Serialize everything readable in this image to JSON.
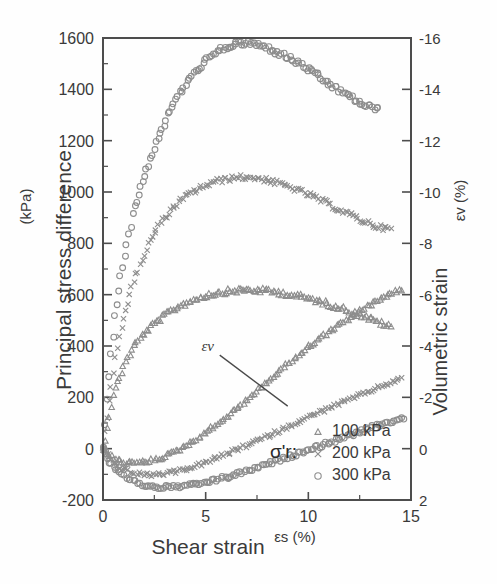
{
  "chart_data": {
    "type": "scatter",
    "title": "",
    "xlabel": "Shear strain",
    "xlabel_unit": "εs (%)",
    "ylabel_left": "Principal stress difference",
    "ylabel_left_unit": "(kPa)",
    "ylabel_right": "Volumetric strain",
    "ylabel_right_unit": "εv (%)",
    "xlim": [
      0,
      15
    ],
    "ylim_left": [
      -200,
      1600
    ],
    "ylim_right": [
      2,
      -16
    ],
    "grid": false,
    "legend_position": "bottom-right",
    "legend_title": "σ'r:",
    "x_ticks": [
      "0",
      "5",
      "10",
      "15"
    ],
    "x_tick_values": [
      0,
      5,
      10,
      15
    ],
    "y_ticks_left": [
      "-200",
      "0",
      "200",
      "400",
      "600",
      "800",
      "1000",
      "1200",
      "1400",
      "1600"
    ],
    "y_tick_values_left": [
      -200,
      0,
      200,
      400,
      600,
      800,
      1000,
      1200,
      1400,
      1600
    ],
    "y_ticks_right": [
      "2",
      "0",
      "-2",
      "-4",
      "-6",
      "-8",
      "-10",
      "-12",
      "-14",
      "-16"
    ],
    "y_tick_values_right": [
      2,
      0,
      -2,
      -4,
      -6,
      -8,
      -10,
      -12,
      -14,
      -16
    ],
    "annotations": [
      {
        "text": "εv",
        "x": 5.1,
        "y_left": 380,
        "note": "label for volumetric strain curves with leader line"
      }
    ],
    "legend": [
      {
        "label": "100 kPa",
        "marker": "triangle"
      },
      {
        "label": "200 kPa",
        "marker": "cross"
      },
      {
        "label": "300 kPa",
        "marker": "circle"
      }
    ],
    "series": [
      {
        "name": "100 kPa",
        "axis": "left",
        "quantity": "principal stress difference",
        "marker": "triangle",
        "x": [
          0.0,
          0.15,
          0.3,
          0.5,
          0.75,
          1.0,
          1.3,
          1.6,
          2.0,
          2.4,
          2.8,
          3.2,
          3.6,
          4.0,
          4.5,
          5.0,
          5.5,
          6.0,
          6.5,
          7.0,
          7.5,
          8.0,
          8.5,
          9.0,
          9.5,
          10.0,
          10.5,
          11.0,
          11.5,
          12.0,
          12.5,
          13.0,
          13.5,
          14.0
        ],
        "y": [
          0,
          60,
          130,
          205,
          270,
          320,
          370,
          410,
          450,
          480,
          505,
          530,
          550,
          565,
          583,
          596,
          605,
          612,
          616,
          618,
          617,
          614,
          609,
          602,
          594,
          585,
          574,
          562,
          550,
          536,
          521,
          505,
          490,
          474
        ]
      },
      {
        "name": "200 kPa",
        "axis": "left",
        "quantity": "principal stress difference",
        "marker": "cross",
        "x": [
          0.0,
          0.2,
          0.4,
          0.7,
          1.0,
          1.4,
          1.8,
          2.2,
          2.6,
          3.0,
          3.5,
          4.0,
          4.5,
          5.0,
          5.5,
          6.0,
          6.5,
          7.0,
          7.5,
          8.0,
          8.5,
          9.0,
          9.5,
          10.0,
          10.5,
          11.0,
          11.5,
          12.0,
          12.5,
          13.0,
          13.5,
          14.0
        ],
        "y": [
          0,
          120,
          250,
          400,
          510,
          625,
          720,
          795,
          855,
          900,
          945,
          980,
          1005,
          1025,
          1040,
          1050,
          1056,
          1058,
          1054,
          1046,
          1035,
          1022,
          1006,
          990,
          972,
          952,
          932,
          912,
          893,
          876,
          862,
          855
        ]
      },
      {
        "name": "300 kPa",
        "axis": "left",
        "quantity": "principal stress difference",
        "marker": "circle",
        "x": [
          0.0,
          0.2,
          0.4,
          0.6,
          0.9,
          1.2,
          1.5,
          1.9,
          2.3,
          2.7,
          3.1,
          3.6,
          4.1,
          4.6,
          5.1,
          5.6,
          6.1,
          6.6,
          7.1,
          7.6,
          8.1,
          8.6,
          9.1,
          9.6,
          10.1,
          10.6,
          11.1,
          11.6,
          12.1,
          12.6,
          13.0,
          13.4
        ],
        "y": [
          0,
          200,
          380,
          530,
          690,
          820,
          930,
          1040,
          1130,
          1215,
          1290,
          1368,
          1430,
          1478,
          1518,
          1548,
          1568,
          1578,
          1580,
          1572,
          1558,
          1540,
          1520,
          1498,
          1472,
          1444,
          1416,
          1392,
          1368,
          1344,
          1330,
          1322
        ]
      },
      {
        "name": "100 kPa",
        "axis": "right",
        "quantity": "volumetric strain",
        "marker": "triangle",
        "x": [
          0.0,
          0.2,
          0.5,
          0.8,
          1.2,
          1.6,
          2.0,
          2.5,
          3.0,
          3.5,
          4.0,
          4.5,
          5.0,
          5.5,
          6.0,
          6.5,
          7.0,
          7.5,
          8.0,
          8.5,
          9.0,
          9.5,
          10.0,
          10.5,
          11.0,
          11.5,
          12.0,
          12.5,
          13.0,
          13.5,
          14.0,
          14.5
        ],
        "y": [
          0.0,
          0.2,
          0.38,
          0.48,
          0.55,
          0.56,
          0.53,
          0.44,
          0.3,
          0.12,
          -0.1,
          -0.35,
          -0.62,
          -0.92,
          -1.22,
          -1.55,
          -1.9,
          -2.25,
          -2.6,
          -2.95,
          -3.3,
          -3.62,
          -3.95,
          -4.25,
          -4.55,
          -4.82,
          -5.1,
          -5.35,
          -5.6,
          -5.82,
          -6.05,
          -6.2
        ]
      },
      {
        "name": "200 kPa",
        "axis": "right",
        "quantity": "volumetric strain",
        "marker": "cross",
        "x": [
          0.0,
          0.3,
          0.6,
          1.0,
          1.5,
          2.0,
          2.5,
          3.0,
          3.5,
          4.0,
          4.5,
          5.0,
          5.5,
          6.0,
          6.5,
          7.0,
          7.5,
          8.0,
          8.5,
          9.0,
          9.5,
          10.0,
          10.5,
          11.0,
          11.5,
          12.0,
          12.5,
          13.0,
          13.5,
          14.0,
          14.5
        ],
        "y": [
          0.0,
          0.35,
          0.6,
          0.8,
          0.95,
          1.02,
          1.02,
          0.98,
          0.9,
          0.8,
          0.68,
          0.54,
          0.38,
          0.22,
          0.05,
          -0.12,
          -0.3,
          -0.48,
          -0.66,
          -0.85,
          -1.04,
          -1.22,
          -1.4,
          -1.58,
          -1.75,
          -1.92,
          -2.08,
          -2.25,
          -2.42,
          -2.58,
          -2.72
        ]
      },
      {
        "name": "300 kPa",
        "axis": "right",
        "quantity": "volumetric strain",
        "marker": "circle",
        "x": [
          0.0,
          0.3,
          0.7,
          1.1,
          1.6,
          2.1,
          2.6,
          3.1,
          3.6,
          4.1,
          4.6,
          5.1,
          5.6,
          6.1,
          6.6,
          7.1,
          7.6,
          8.1,
          8.6,
          9.1,
          9.6,
          10.1,
          10.6,
          11.1,
          11.6,
          12.1,
          12.6,
          13.1,
          13.6,
          14.1,
          14.6
        ],
        "y": [
          0.0,
          0.5,
          0.85,
          1.1,
          1.32,
          1.45,
          1.5,
          1.5,
          1.48,
          1.44,
          1.38,
          1.3,
          1.2,
          1.1,
          0.98,
          0.85,
          0.72,
          0.58,
          0.44,
          0.3,
          0.16,
          0.02,
          -0.12,
          -0.26,
          -0.4,
          -0.54,
          -0.68,
          -0.82,
          -0.95,
          -1.08,
          -1.2
        ]
      }
    ]
  }
}
